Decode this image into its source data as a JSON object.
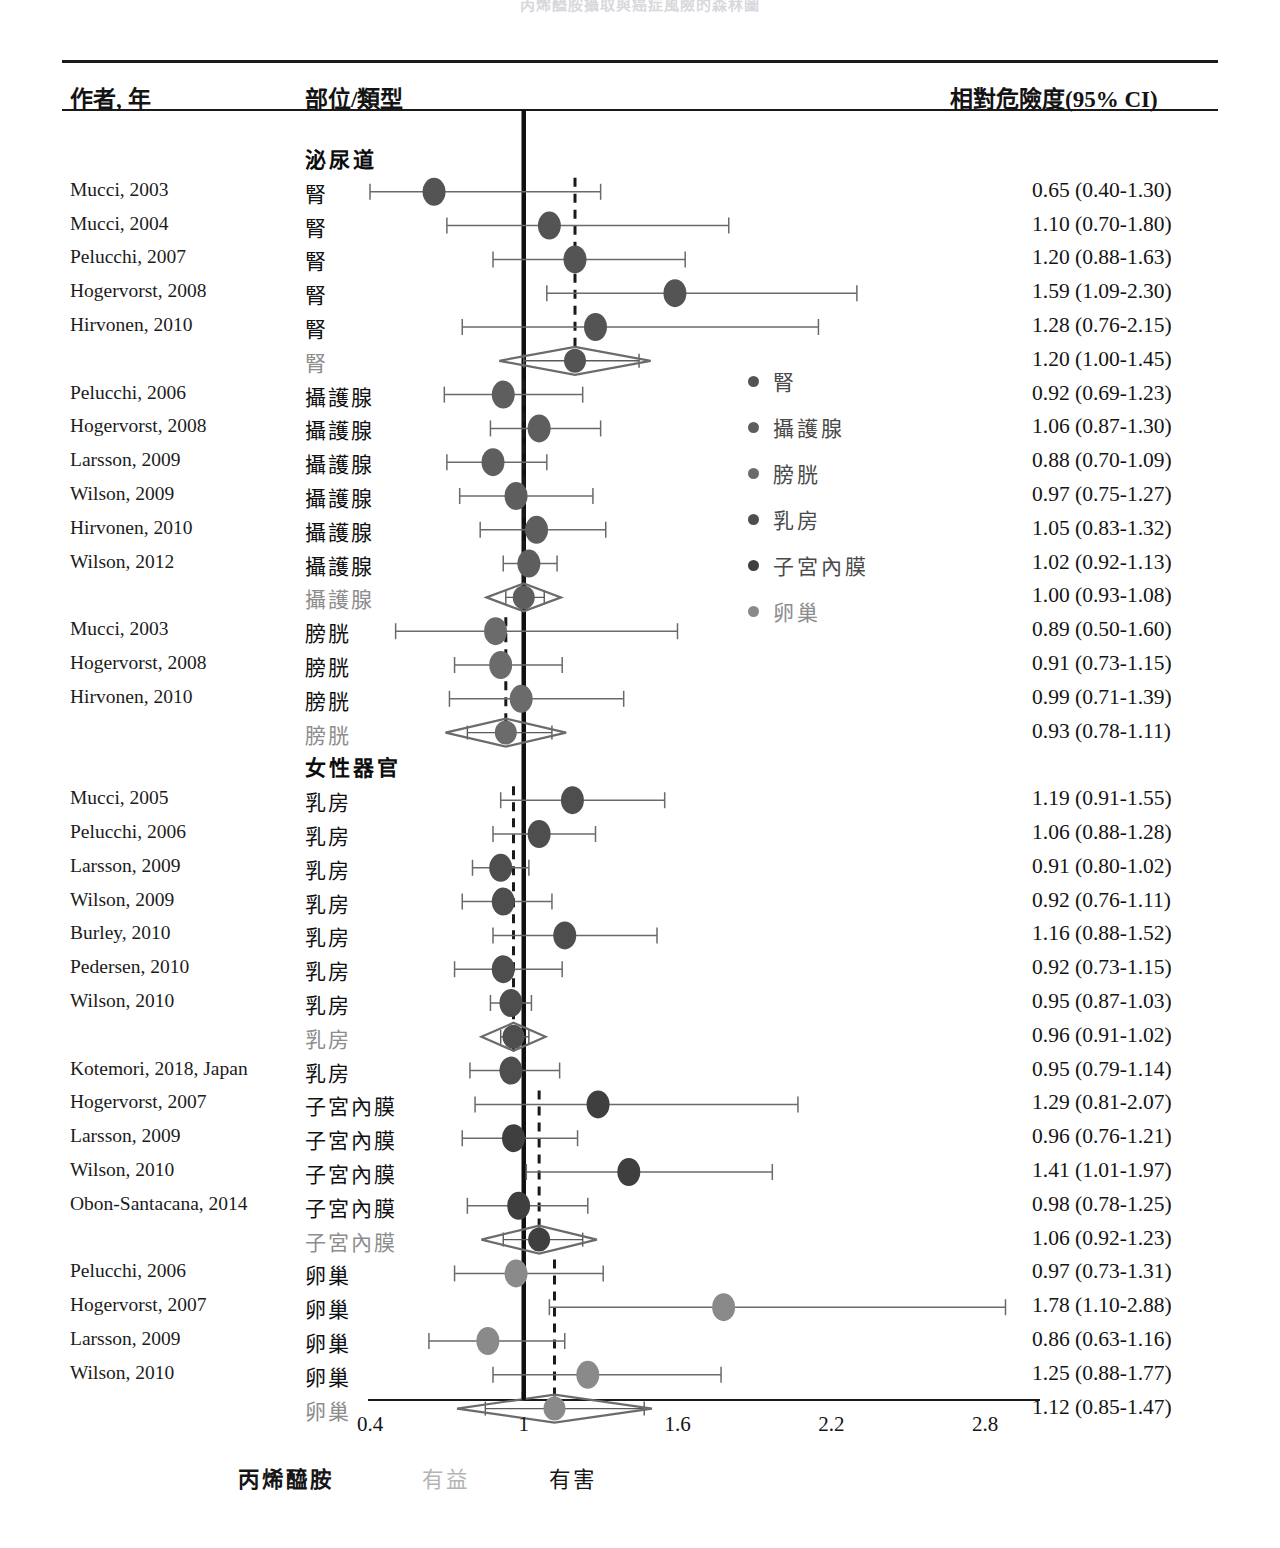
{
  "title": "丙烯醯胺攝取與癌症風險的森林圖",
  "header": {
    "author": "作者, 年",
    "site": "部位/類型",
    "rr": "相對危險度(95% CI)"
  },
  "axis": {
    "ticks": [
      "0.4",
      "1",
      "1.6",
      "2.2",
      "2.8"
    ],
    "tick_values": [
      0.4,
      1.0,
      1.6,
      2.2,
      2.8
    ],
    "null_value": 1.0
  },
  "footer": {
    "exposure": "丙烯醯胺",
    "benefit": "有益",
    "harm": "有害"
  },
  "legend": {
    "items": [
      {
        "label": "腎",
        "color": "#545454"
      },
      {
        "label": "攝護腺",
        "color": "#5e5e5e"
      },
      {
        "label": "膀胱",
        "color": "#6b6b6b"
      },
      {
        "label": "乳房",
        "color": "#4e4e4e"
      },
      {
        "label": "子宮內膜",
        "color": "#3f3f3f"
      },
      {
        "label": "卵巢",
        "color": "#8a8a8a"
      }
    ]
  },
  "chart_data": {
    "type": "forest",
    "title": "丙烯醯胺攝取與癌症風險的森林圖",
    "xlabel": "相對危險度 (95% CI)",
    "xlim": [
      0.28,
      3.0
    ],
    "null_line": 1.0,
    "x_ticks": [
      0.4,
      1.0,
      1.6,
      2.2,
      2.8
    ],
    "x_tick_labels": [
      "0.4",
      "1",
      "1.6",
      "2.2",
      "2.8"
    ],
    "grid": false,
    "legend_position": "inside-right",
    "groups": [
      {
        "name": "泌尿道",
        "is_group_header": true,
        "subgroups": [
          {
            "site": "腎",
            "color": "#545454",
            "pooled": 1.2,
            "rows": [
              {
                "author": "Mucci, 2003",
                "site": "腎",
                "rr": 0.65,
                "lo": 0.4,
                "hi": 1.3,
                "text": "0.65 (0.40-1.30)",
                "summary": false
              },
              {
                "author": "Mucci, 2004",
                "site": "腎",
                "rr": 1.1,
                "lo": 0.7,
                "hi": 1.8,
                "text": "1.10 (0.70-1.80)",
                "summary": false
              },
              {
                "author": "Pelucchi, 2007",
                "site": "腎",
                "rr": 1.2,
                "lo": 0.88,
                "hi": 1.63,
                "text": "1.20 (0.88-1.63)",
                "summary": false
              },
              {
                "author": "Hogervorst, 2008",
                "site": "腎",
                "rr": 1.59,
                "lo": 1.09,
                "hi": 2.3,
                "text": "1.59 (1.09-2.30)",
                "summary": false
              },
              {
                "author": "Hirvonen, 2010",
                "site": "腎",
                "rr": 1.28,
                "lo": 0.76,
                "hi": 2.15,
                "text": "1.28 (0.76-2.15)",
                "summary": false
              },
              {
                "author": "",
                "site": "腎",
                "rr": 1.2,
                "lo": 1.0,
                "hi": 1.45,
                "text": "1.20 (1.00-1.45)",
                "summary": true
              }
            ]
          },
          {
            "site": "攝護腺",
            "color": "#5e5e5e",
            "pooled": 1.0,
            "rows": [
              {
                "author": "Pelucchi, 2006",
                "site": "攝護腺",
                "rr": 0.92,
                "lo": 0.69,
                "hi": 1.23,
                "text": "0.92 (0.69-1.23)",
                "summary": false
              },
              {
                "author": "Hogervorst, 2008",
                "site": "攝護腺",
                "rr": 1.06,
                "lo": 0.87,
                "hi": 1.3,
                "text": "1.06 (0.87-1.30)",
                "summary": false
              },
              {
                "author": "Larsson, 2009",
                "site": "攝護腺",
                "rr": 0.88,
                "lo": 0.7,
                "hi": 1.09,
                "text": "0.88 (0.70-1.09)",
                "summary": false
              },
              {
                "author": "Wilson, 2009",
                "site": "攝護腺",
                "rr": 0.97,
                "lo": 0.75,
                "hi": 1.27,
                "text": "0.97 (0.75-1.27)",
                "summary": false
              },
              {
                "author": "Hirvonen, 2010",
                "site": "攝護腺",
                "rr": 1.05,
                "lo": 0.83,
                "hi": 1.32,
                "text": "1.05 (0.83-1.32)",
                "summary": false
              },
              {
                "author": "Wilson, 2012",
                "site": "攝護腺",
                "rr": 1.02,
                "lo": 0.92,
                "hi": 1.13,
                "text": "1.02 (0.92-1.13)",
                "summary": false
              },
              {
                "author": "",
                "site": "攝護腺",
                "rr": 1.0,
                "lo": 0.93,
                "hi": 1.08,
                "text": "1.00 (0.93-1.08)",
                "summary": true
              }
            ]
          },
          {
            "site": "膀胱",
            "color": "#6b6b6b",
            "pooled": 0.93,
            "rows": [
              {
                "author": "Mucci, 2003",
                "site": "膀胱",
                "rr": 0.89,
                "lo": 0.5,
                "hi": 1.6,
                "text": "0.89 (0.50-1.60)",
                "summary": false
              },
              {
                "author": "Hogervorst, 2008",
                "site": "膀胱",
                "rr": 0.91,
                "lo": 0.73,
                "hi": 1.15,
                "text": "0.91 (0.73-1.15)",
                "summary": false
              },
              {
                "author": "Hirvonen, 2010",
                "site": "膀胱",
                "rr": 0.99,
                "lo": 0.71,
                "hi": 1.39,
                "text": "0.99 (0.71-1.39)",
                "summary": false
              },
              {
                "author": "",
                "site": "膀胱",
                "rr": 0.93,
                "lo": 0.78,
                "hi": 1.11,
                "text": "0.93 (0.78-1.11)",
                "summary": true
              }
            ]
          }
        ]
      },
      {
        "name": "女性器官",
        "is_group_header": true,
        "subgroups": [
          {
            "site": "乳房",
            "color": "#4e4e4e",
            "pooled": 0.96,
            "rows": [
              {
                "author": "Mucci, 2005",
                "site": "乳房",
                "rr": 1.19,
                "lo": 0.91,
                "hi": 1.55,
                "text": "1.19 (0.91-1.55)",
                "summary": false
              },
              {
                "author": "Pelucchi, 2006",
                "site": "乳房",
                "rr": 1.06,
                "lo": 0.88,
                "hi": 1.28,
                "text": "1.06 (0.88-1.28)",
                "summary": false
              },
              {
                "author": "Larsson, 2009",
                "site": "乳房",
                "rr": 0.91,
                "lo": 0.8,
                "hi": 1.02,
                "text": "0.91 (0.80-1.02)",
                "summary": false
              },
              {
                "author": "Wilson, 2009",
                "site": "乳房",
                "rr": 0.92,
                "lo": 0.76,
                "hi": 1.11,
                "text": "0.92 (0.76-1.11)",
                "summary": false
              },
              {
                "author": "Burley, 2010",
                "site": "乳房",
                "rr": 1.16,
                "lo": 0.88,
                "hi": 1.52,
                "text": "1.16 (0.88-1.52)",
                "summary": false
              },
              {
                "author": "Pedersen, 2010",
                "site": "乳房",
                "rr": 0.92,
                "lo": 0.73,
                "hi": 1.15,
                "text": "0.92 (0.73-1.15)",
                "summary": false
              },
              {
                "author": "Wilson, 2010",
                "site": "乳房",
                "rr": 0.95,
                "lo": 0.87,
                "hi": 1.03,
                "text": "0.95 (0.87-1.03)",
                "summary": false
              },
              {
                "author": "",
                "site": "乳房",
                "rr": 0.96,
                "lo": 0.91,
                "hi": 1.02,
                "text": "0.96 (0.91-1.02)",
                "summary": true
              },
              {
                "author": "Kotemori, 2018, Japan",
                "site": "乳房",
                "rr": 0.95,
                "lo": 0.79,
                "hi": 1.14,
                "text": "0.95 (0.79-1.14)",
                "summary": false
              }
            ]
          },
          {
            "site": "子宮內膜",
            "color": "#3f3f3f",
            "pooled": 1.06,
            "rows": [
              {
                "author": "Hogervorst, 2007",
                "site": "子宮內膜",
                "rr": 1.29,
                "lo": 0.81,
                "hi": 2.07,
                "text": "1.29 (0.81-2.07)",
                "summary": false
              },
              {
                "author": "Larsson, 2009",
                "site": "子宮內膜",
                "rr": 0.96,
                "lo": 0.76,
                "hi": 1.21,
                "text": "0.96 (0.76-1.21)",
                "summary": false
              },
              {
                "author": "Wilson, 2010",
                "site": "子宮內膜",
                "rr": 1.41,
                "lo": 1.01,
                "hi": 1.97,
                "text": "1.41 (1.01-1.97)",
                "summary": false
              },
              {
                "author": "Obon-Santacana, 2014",
                "site": "子宮內膜",
                "rr": 0.98,
                "lo": 0.78,
                "hi": 1.25,
                "text": "0.98 (0.78-1.25)",
                "summary": false
              },
              {
                "author": "",
                "site": "子宮內膜",
                "rr": 1.06,
                "lo": 0.92,
                "hi": 1.23,
                "text": "1.06 (0.92-1.23)",
                "summary": true
              }
            ]
          },
          {
            "site": "卵巢",
            "color": "#8a8a8a",
            "pooled": 1.12,
            "rows": [
              {
                "author": "Pelucchi, 2006",
                "site": "卵巢",
                "rr": 0.97,
                "lo": 0.73,
                "hi": 1.31,
                "text": "0.97 (0.73-1.31)",
                "summary": false
              },
              {
                "author": "Hogervorst, 2007",
                "site": "卵巢",
                "rr": 1.78,
                "lo": 1.1,
                "hi": 2.88,
                "text": "1.78 (1.10-2.88)",
                "summary": false
              },
              {
                "author": "Larsson, 2009",
                "site": "卵巢",
                "rr": 0.86,
                "lo": 0.63,
                "hi": 1.16,
                "text": "0.86 (0.63-1.16)",
                "summary": false
              },
              {
                "author": "Wilson, 2010",
                "site": "卵巢",
                "rr": 1.25,
                "lo": 0.88,
                "hi": 1.77,
                "text": "1.25 (0.88-1.77)",
                "summary": false
              },
              {
                "author": "",
                "site": "卵巢",
                "rr": 1.12,
                "lo": 0.85,
                "hi": 1.47,
                "text": "1.12 (0.85-1.47)",
                "summary": true
              }
            ]
          }
        ]
      }
    ]
  }
}
